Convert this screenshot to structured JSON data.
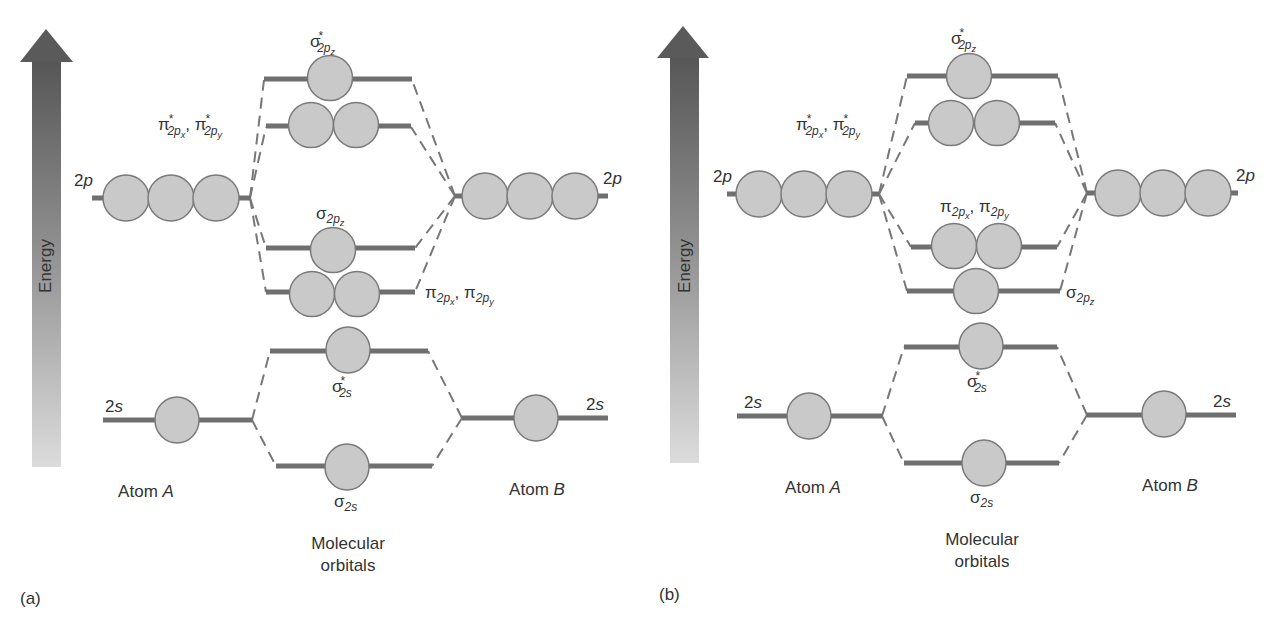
{
  "figure": {
    "colors": {
      "level_line": "#6f6f6f",
      "orbital_fill": "#c9c9c9",
      "orbital_stroke": "#7a7a7a",
      "dash": "#777777",
      "arrow_top": "#5a5a5a",
      "arrow_bottom": "#dadada",
      "text": "#333333"
    },
    "panels": [
      {
        "id": "a",
        "panel_label": "(a)",
        "axis_label": "Energy",
        "atom_a": {
          "label": "Atom",
          "label_italic": "A",
          "levels": [
            {
              "name": "2",
              "name_italic": "p"
            },
            {
              "name": "2",
              "name_italic": "s"
            }
          ]
        },
        "atom_b": {
          "label": "Atom",
          "label_italic": "B",
          "levels": [
            {
              "name": "2",
              "name_italic": "p"
            },
            {
              "name": "2",
              "name_italic": "s"
            }
          ]
        },
        "mo_column_label": [
          "Molecular",
          "orbitals"
        ],
        "mo_order_top_to_bottom": [
          "σ*2pz",
          "π*2px, π*2py",
          "σ2pz",
          "π2px, π2py",
          "σ*2s",
          "σ2s"
        ],
        "mo_labels": {
          "sigma_star_2pz": {
            "sym": "σ",
            "star": "*",
            "sub": "2p",
            "subsub": "z"
          },
          "pi_star_2p": {
            "sym1": "π",
            "star": "*",
            "sub1": "2p",
            "subsub1": "x",
            "sep": ", ",
            "sym2": "π",
            "sub2": "2p",
            "subsub2": "y"
          },
          "sigma_2pz": {
            "sym": "σ",
            "sub": "2p",
            "subsub": "z"
          },
          "pi_2p": {
            "sym1": "π",
            "sub1": "2p",
            "subsub1": "x",
            "sep": ", ",
            "sym2": "π",
            "sub2": "2p",
            "subsub2": "y"
          },
          "sigma_star_2s": {
            "sym": "σ",
            "star": "*",
            "sub": "2s"
          },
          "sigma_2s": {
            "sym": "σ",
            "sub": "2s"
          }
        }
      },
      {
        "id": "b",
        "panel_label": "(b)",
        "axis_label": "Energy",
        "atom_a": {
          "label": "Atom",
          "label_italic": "A",
          "levels": [
            {
              "name": "2",
              "name_italic": "p"
            },
            {
              "name": "2",
              "name_italic": "s"
            }
          ]
        },
        "atom_b": {
          "label": "Atom",
          "label_italic": "B",
          "levels": [
            {
              "name": "2",
              "name_italic": "p"
            },
            {
              "name": "2",
              "name_italic": "s"
            }
          ]
        },
        "mo_column_label": [
          "Molecular",
          "orbitals"
        ],
        "mo_order_top_to_bottom": [
          "σ*2pz",
          "π*2px, π*2py",
          "π2px, π2py",
          "σ2pz",
          "σ*2s",
          "σ2s"
        ],
        "mo_labels": {
          "sigma_star_2pz": {
            "sym": "σ",
            "star": "*",
            "sub": "2p",
            "subsub": "z"
          },
          "pi_star_2p": {
            "sym1": "π",
            "star": "*",
            "sub1": "2p",
            "subsub1": "x",
            "sep": ", ",
            "sym2": "π",
            "sub2": "2p",
            "subsub2": "y"
          },
          "sigma_2pz": {
            "sym": "σ",
            "sub": "2p",
            "subsub": "z"
          },
          "pi_2p": {
            "sym1": "π",
            "sub1": "2p",
            "subsub1": "x",
            "sep": ", ",
            "sym2": "π",
            "sub2": "2p",
            "subsub2": "y"
          },
          "sigma_star_2s": {
            "sym": "σ",
            "star": "*",
            "sub": "2s"
          },
          "sigma_2s": {
            "sym": "σ",
            "sub": "2s"
          }
        }
      }
    ]
  }
}
